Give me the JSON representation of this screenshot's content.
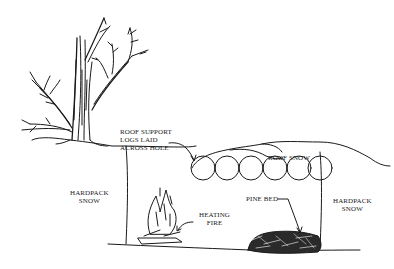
{
  "diagram": {
    "labels": {
      "roof_support": [
        "ROOF SUPPORT",
        "LOGS LAID",
        "ACROSS HOLE"
      ],
      "roof_snow": "ROOF SNOW",
      "hardpack_left": [
        "HARDPACK",
        "SNOW"
      ],
      "hardpack_right": [
        "HARDPACK",
        "SNOW"
      ],
      "heating_fire": [
        "HEATING",
        "FIRE"
      ],
      "pine_bed": "PINE BED"
    },
    "elements": {
      "tree": "bare-tree",
      "logs_count": 7,
      "fire": "campfire",
      "bed": "pine-bough-bed"
    },
    "colors": {
      "ink": "#1a1a1a",
      "background": "#ffffff"
    }
  }
}
